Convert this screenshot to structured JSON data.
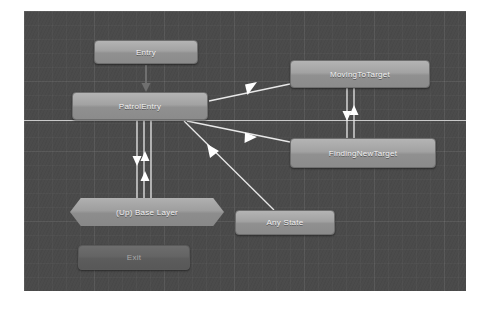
{
  "window": {
    "title": "Animator State Machine Graph"
  },
  "canvas": {
    "background_color": "#4a4a4a",
    "grid": "on",
    "divider_color": "#c9c9c9",
    "node_fill_color": "#a2a2a2",
    "node_dim_fill_color": "#646464",
    "edge_color": "#e6e6e6",
    "label_color": "#f2f2f2"
  },
  "graph": {
    "nodes": [
      {
        "id": "entry",
        "label": "Entry",
        "shape": "rounded-rect",
        "style": "normal"
      },
      {
        "id": "patrolEntry",
        "label": "PatrolEntry",
        "shape": "rounded-rect",
        "style": "normal"
      },
      {
        "id": "movingToTarget",
        "label": "MovingToTarget",
        "shape": "rounded-rect",
        "style": "normal"
      },
      {
        "id": "findingNewTarget",
        "label": "FindingNewTarget",
        "shape": "rounded-rect",
        "style": "normal"
      },
      {
        "id": "baseLayer",
        "label": "(Up) Base Layer",
        "shape": "hexagon",
        "style": "normal"
      },
      {
        "id": "anyState",
        "label": "Any State",
        "shape": "rounded-rect",
        "style": "normal"
      },
      {
        "id": "exit",
        "label": "Exit",
        "shape": "rounded-rect",
        "style": "dim"
      }
    ],
    "transitions": [
      {
        "from": "entry",
        "to": "patrolEntry",
        "direction": "down",
        "arrows": 1
      },
      {
        "from": "patrolEntry",
        "to": "movingToTarget",
        "direction": "right",
        "arrows": 1
      },
      {
        "from": "patrolEntry",
        "to": "findingNewTarget",
        "direction": "right",
        "arrows": 1
      },
      {
        "from": "movingToTarget",
        "to": "findingNewTarget",
        "direction": "both",
        "arrows": 2
      },
      {
        "from": "baseLayer",
        "to": "patrolEntry",
        "direction": "both",
        "arrows": 3
      },
      {
        "from": "anyState",
        "to": "patrolEntry",
        "direction": "up",
        "arrows": 1
      }
    ]
  }
}
